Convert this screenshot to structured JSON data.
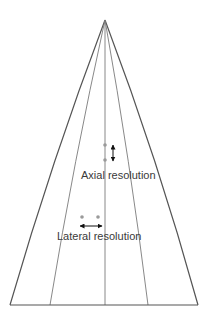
{
  "diagram": {
    "labels": {
      "axial": "Axial resolution",
      "lateral": "Lateral resolution"
    },
    "colors": {
      "outline": "#555555",
      "scan_line": "#7a7a7a",
      "dot": "#9a9a9a",
      "arrow": "#111111",
      "text": "#3a3a3a"
    },
    "geometry": {
      "apex": [
        105,
        20
      ],
      "bottom_y": 305,
      "outer_left_end": [
        10,
        305
      ],
      "outer_right_end": [
        198,
        305
      ],
      "inner_left_end": [
        50,
        305
      ],
      "inner_right_end": [
        148,
        305
      ],
      "center_end": [
        105,
        305
      ],
      "axial_dots": [
        [
          105,
          145
        ],
        [
          105,
          160
        ]
      ],
      "axial_arrow": {
        "x": 113,
        "y1": 144,
        "y2": 162
      },
      "lateral_dots": [
        [
          82,
          217
        ],
        [
          98,
          217
        ]
      ],
      "lateral_arrow": {
        "y": 226,
        "x1": 79,
        "x2": 103
      }
    }
  }
}
